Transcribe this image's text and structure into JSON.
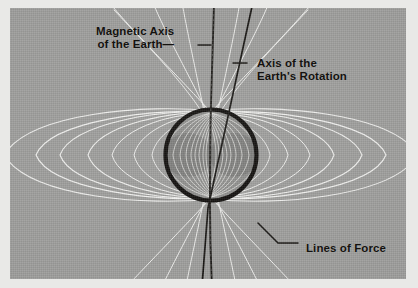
{
  "figure": {
    "kind": "diagram-photograph",
    "background_color": "#9d9d9b",
    "margin_color": "#e9e9e7"
  },
  "labels": {
    "magnetic_axis": {
      "line1": "Magnetic Axis",
      "line2": "of the Earth—"
    },
    "rotation_axis": {
      "line1": "Axis of the",
      "line2": "Earth's Rotation"
    },
    "lines_of_force": {
      "text": "Lines of Force"
    }
  },
  "earth": {
    "outline_color": "#0d0b09",
    "fill_color": "#8f8f8d",
    "lobe_color": "#7b7b79",
    "center_x": 201,
    "center_y": 147,
    "radius": 48
  },
  "field_lines": {
    "color": "#f0f0ee",
    "count_per_side": 9
  },
  "axes": {
    "magnetic_axis_color": "#1a1815",
    "rotation_axis_color": "#15130f",
    "rotation_tilt_degrees": 11
  },
  "leaders": {
    "color": "#14120f"
  }
}
